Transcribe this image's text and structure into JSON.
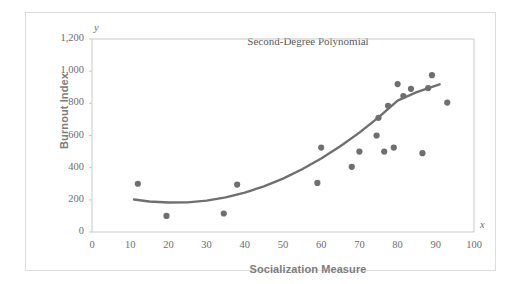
{
  "chart_data": {
    "type": "scatter",
    "title": "Second-Degree Polynomial",
    "xlabel": "Socialization Measure",
    "ylabel": "Burnout Index",
    "x_axis_variable": "x",
    "y_axis_variable": "y",
    "xlim": [
      0,
      100
    ],
    "ylim": [
      0,
      1200
    ],
    "grid": false,
    "legend": null,
    "x_ticks": [
      0,
      10,
      20,
      30,
      40,
      50,
      60,
      70,
      80,
      90,
      100
    ],
    "x_tick_labels": [
      "0",
      "10",
      "20",
      "30",
      "40",
      "50",
      "60",
      "70",
      "80",
      "90",
      "100"
    ],
    "y_ticks": [
      0,
      200,
      400,
      600,
      800,
      1000,
      1200
    ],
    "y_tick_labels": [
      "0",
      "200",
      "400",
      "600",
      "800",
      "1,000",
      "1,200"
    ],
    "point_color": "#6f6f71",
    "curve_color": "#6f6f71",
    "frame_color": "#c9c9c9",
    "points": [
      {
        "x": 12,
        "y": 300
      },
      {
        "x": 19.5,
        "y": 100
      },
      {
        "x": 34.5,
        "y": 115
      },
      {
        "x": 38,
        "y": 295
      },
      {
        "x": 59,
        "y": 305
      },
      {
        "x": 60,
        "y": 525
      },
      {
        "x": 68,
        "y": 405
      },
      {
        "x": 70,
        "y": 500
      },
      {
        "x": 74.5,
        "y": 600
      },
      {
        "x": 75,
        "y": 710
      },
      {
        "x": 76.5,
        "y": 500
      },
      {
        "x": 77.5,
        "y": 785
      },
      {
        "x": 79,
        "y": 525
      },
      {
        "x": 80,
        "y": 920
      },
      {
        "x": 81.5,
        "y": 845
      },
      {
        "x": 83.5,
        "y": 890
      },
      {
        "x": 86.5,
        "y": 490
      },
      {
        "x": 88,
        "y": 895
      },
      {
        "x": 89,
        "y": 975
      },
      {
        "x": 93,
        "y": 805
      }
    ],
    "fit_curve": {
      "kind": "quadratic",
      "x_range": [
        11,
        91
      ],
      "points": [
        {
          "x": 11,
          "y": 202
        },
        {
          "x": 15,
          "y": 190
        },
        {
          "x": 20,
          "y": 183
        },
        {
          "x": 25,
          "y": 184
        },
        {
          "x": 30,
          "y": 195
        },
        {
          "x": 35,
          "y": 215
        },
        {
          "x": 40,
          "y": 245
        },
        {
          "x": 45,
          "y": 284
        },
        {
          "x": 50,
          "y": 332
        },
        {
          "x": 55,
          "y": 390
        },
        {
          "x": 60,
          "y": 457
        },
        {
          "x": 65,
          "y": 533
        },
        {
          "x": 70,
          "y": 618
        },
        {
          "x": 75,
          "y": 713
        },
        {
          "x": 80,
          "y": 817
        },
        {
          "x": 85,
          "y": 870
        },
        {
          "x": 91,
          "y": 918
        }
      ]
    }
  }
}
